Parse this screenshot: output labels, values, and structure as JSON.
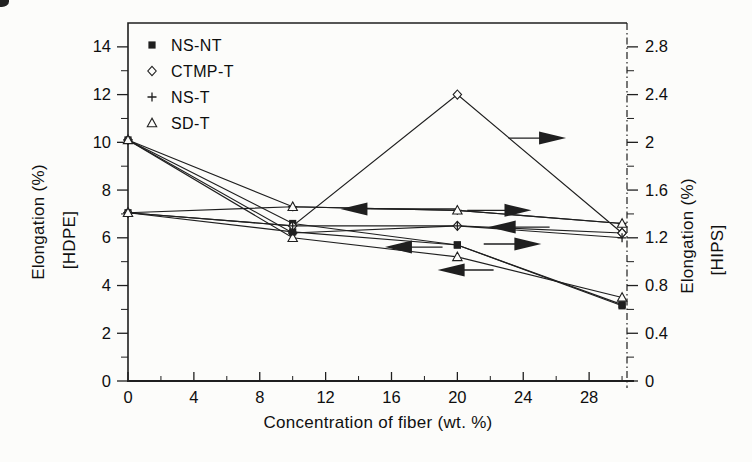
{
  "figure": {
    "background": "#fcfcfa",
    "ink": "#1f1f1f"
  },
  "chart_data": {
    "type": "line",
    "title": "",
    "xlabel": "Concentration of fiber (wt. %)",
    "ylabel_left": [
      "Elongation (%)",
      "[HDPE]"
    ],
    "ylabel_right": [
      "Elongation (%)",
      "[HIPS]"
    ],
    "x": [
      0,
      10,
      20,
      30
    ],
    "xlim": [
      0,
      30.3
    ],
    "x_ticks_major": [
      0,
      4,
      8,
      12,
      16,
      20,
      24,
      28
    ],
    "x_ticks_minor": [
      2,
      6,
      10,
      14,
      18,
      22,
      26,
      30
    ],
    "ylim_left": [
      0,
      15
    ],
    "y_ticks_left": [
      0,
      2,
      4,
      6,
      8,
      10,
      12,
      14
    ],
    "y_ticks_left_minor": [
      1,
      3,
      5,
      7,
      9,
      11,
      13
    ],
    "ylim_right": [
      0,
      3
    ],
    "y_ticks_right": [
      0,
      0.4,
      0.8,
      1.2,
      1.6,
      2,
      2.4,
      2.8
    ],
    "y_ticks_right_minor": [
      0.2,
      0.6,
      1.0,
      1.4,
      1.8,
      2.2,
      2.6
    ],
    "legend": [
      {
        "label": "NS-NT",
        "marker": "square-filled"
      },
      {
        "label": "CTMP-T",
        "marker": "diamond-open"
      },
      {
        "label": "NS-T",
        "marker": "plus"
      },
      {
        "label": "SD-T",
        "marker": "triangle-open"
      }
    ],
    "series": [
      {
        "name": "NS-NT (HDPE)",
        "axis": "left",
        "marker": "square-filled",
        "values": [
          10.1,
          6.6,
          5.7,
          3.2
        ]
      },
      {
        "name": "CTMP-T (HDPE)",
        "axis": "left",
        "marker": "diamond-open",
        "values": [
          10.1,
          6.2,
          6.5,
          6.2
        ]
      },
      {
        "name": "NS-T (HDPE)",
        "axis": "left",
        "marker": "plus",
        "values": [
          10.1,
          7.3,
          7.15,
          6.6
        ]
      },
      {
        "name": "SD-T (HDPE)",
        "axis": "left",
        "marker": "triangle-open",
        "values": [
          10.1,
          6.0,
          5.2,
          3.5
        ]
      },
      {
        "name": "NS-NT (HIPS)",
        "axis": "right",
        "marker": "square-filled",
        "values": [
          1.41,
          1.25,
          1.14,
          0.63
        ]
      },
      {
        "name": "CTMP-T (HIPS)",
        "axis": "right",
        "marker": "diamond-open",
        "values": [
          1.41,
          1.3,
          2.4,
          1.24
        ]
      },
      {
        "name": "NS-T (HIPS)",
        "axis": "right",
        "marker": "plus",
        "values": [
          1.41,
          1.3,
          1.3,
          1.2
        ]
      },
      {
        "name": "SD-T (HIPS)",
        "axis": "right",
        "marker": "triangle-open",
        "values": [
          1.41,
          1.46,
          1.43,
          1.32
        ]
      }
    ],
    "arrows": [
      {
        "x1": 23.1,
        "x2": 26.6,
        "y": 10.18,
        "dir": "right"
      },
      {
        "x1": 19.9,
        "x2": 12.9,
        "y": 7.21,
        "dir": "left"
      },
      {
        "x1": 20.6,
        "x2": 24.5,
        "y": 7.15,
        "dir": "right"
      },
      {
        "x1": 25.6,
        "x2": 21.9,
        "y": 6.45,
        "dir": "left"
      },
      {
        "x1": 21.6,
        "x2": 25.1,
        "y": 5.74,
        "dir": "right"
      },
      {
        "x1": 19.1,
        "x2": 15.6,
        "y": 5.61,
        "dir": "left"
      },
      {
        "x1": 22.2,
        "x2": 18.8,
        "y": 4.65,
        "dir": "left"
      }
    ]
  }
}
